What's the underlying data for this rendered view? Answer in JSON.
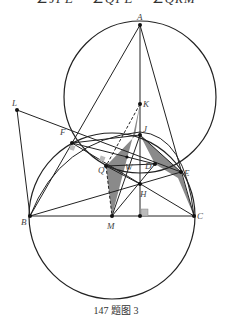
{
  "header": {
    "partial_text": "∠JFE = ∠QFE = ∠QRM"
  },
  "figure": {
    "caption": "147 题图 3",
    "points": {
      "A": "A",
      "K": "K",
      "J": "J",
      "L": "L",
      "F": "F",
      "Q": "Q",
      "W": "W",
      "D": "D",
      "E": "E",
      "H": "H",
      "B": "B",
      "M": "M",
      "C": "C"
    },
    "colors": {
      "line": "#222222",
      "shade": "#8a8a8a",
      "right_angle_mark": "#bbbbbb"
    }
  }
}
